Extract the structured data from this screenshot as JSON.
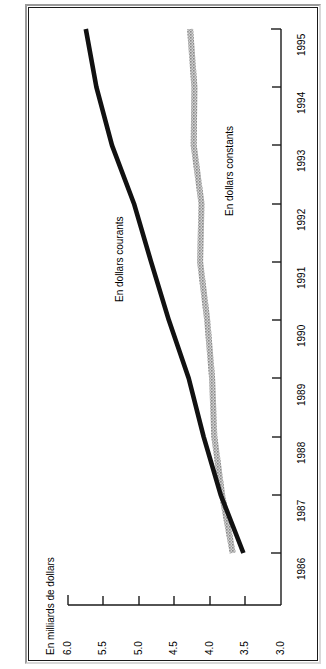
{
  "figure": {
    "title": "Dépenses en dollars courants et en dollars constants, Canada, 1985-1986 à 1994-1995"
  },
  "chart_data": {
    "type": "line",
    "orientation": "horizontal-value-axis",
    "title": "Dépenses en dollars courants et en dollars constants, Canada, 1985-1986 à 1994-1995",
    "xlabel": "En milliards de dollars",
    "ylabel": "",
    "value_axis_title": "En milliards de dollars",
    "value_ticks": [
      "6.0",
      "5.5",
      "5.0",
      "4.5",
      "4.0",
      "3.5",
      "3.0"
    ],
    "value_tick_values": [
      6.0,
      5.5,
      5.0,
      4.5,
      4.0,
      3.5,
      3.0
    ],
    "vlim": [
      6.0,
      3.0
    ],
    "categories": [
      "1986",
      "1987",
      "1988",
      "1989",
      "1990",
      "1991",
      "1992",
      "1993",
      "1994",
      "1995"
    ],
    "grid": false,
    "legend_position": "inline-annotations",
    "series": [
      {
        "name": "En dollars courants",
        "color": "#111111",
        "style": "solid",
        "values": [
          3.53,
          3.85,
          4.09,
          4.3,
          4.58,
          4.83,
          5.07,
          5.38,
          5.6,
          5.75
        ]
      },
      {
        "name": "En dollars constants",
        "color": "#8c8c8c",
        "style": "hatched",
        "values": [
          3.68,
          3.83,
          3.94,
          3.97,
          4.04,
          4.14,
          4.12,
          4.23,
          4.22,
          4.28
        ]
      }
    ],
    "annotations": [
      {
        "text": "En dollars courants",
        "series": "En dollars courants"
      },
      {
        "text": "En dollars constants",
        "series": "En dollars constants"
      }
    ]
  },
  "colors": {
    "courants": "#111111",
    "constants": "#8c8c8c",
    "axis": "#1a1a1a",
    "background": "#ffffff"
  }
}
